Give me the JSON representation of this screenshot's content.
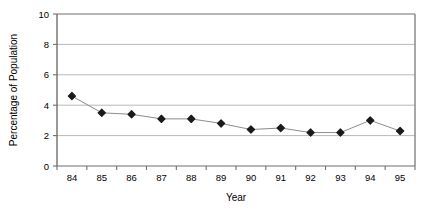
{
  "chart_data": {
    "type": "line",
    "title": "",
    "xlabel": "Year",
    "ylabel": "Percentage of Population",
    "categories": [
      "84",
      "85",
      "86",
      "87",
      "88",
      "89",
      "90",
      "91",
      "92",
      "93",
      "94",
      "95"
    ],
    "values": [
      4.6,
      3.5,
      3.4,
      3.1,
      3.1,
      2.8,
      2.4,
      2.5,
      2.2,
      2.2,
      3.0,
      2.3
    ],
    "series": [
      {
        "name": "Percentage of Population",
        "values": [
          4.6,
          3.5,
          3.4,
          3.1,
          3.1,
          2.8,
          2.4,
          2.5,
          2.2,
          2.2,
          3.0,
          2.3
        ]
      }
    ],
    "ylim": [
      0,
      10
    ],
    "yticks": [
      "0",
      "2",
      "4",
      "6",
      "8",
      "10"
    ],
    "ytick_values": [
      0,
      2,
      4,
      6,
      8,
      10
    ],
    "xticks": [
      "84",
      "85",
      "86",
      "87",
      "88",
      "89",
      "90",
      "91",
      "92",
      "93",
      "94",
      "95"
    ],
    "grid": true,
    "grid_axis": "y",
    "legend": false,
    "legend_position": "none",
    "marker": "diamond",
    "marker_color": "#1a1a1a",
    "line_color": "#8c8c8c",
    "grid_color": "#b0b0b0",
    "axis_color": "#6e6e6e",
    "plot_background": "#ffffff"
  }
}
